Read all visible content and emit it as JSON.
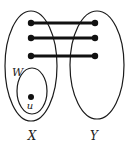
{
  "diagram": {
    "sets": [
      {
        "id": "X",
        "label": "X",
        "cx": 31,
        "cy": 66,
        "rx": 26,
        "ry": 55,
        "label_x": 32,
        "label_y": 140
      },
      {
        "id": "Y",
        "label": "Y",
        "cx": 97,
        "cy": 65,
        "rx": 27,
        "ry": 54,
        "label_x": 94,
        "label_y": 140
      }
    ],
    "subset": {
      "id": "W",
      "label": "W",
      "cx": 32,
      "cy": 91,
      "rx": 15,
      "ry": 23,
      "label_x": 12,
      "label_y": 76
    },
    "special_vertex": {
      "label": "u",
      "x": 31,
      "y": 97,
      "label_x": 30,
      "label_y": 109
    },
    "edges": [
      {
        "x1": 31,
        "y1": 23,
        "x2": 95,
        "y2": 23
      },
      {
        "x1": 31,
        "y1": 38,
        "x2": 95,
        "y2": 38
      },
      {
        "x1": 31,
        "y1": 56,
        "x2": 95,
        "y2": 56
      }
    ],
    "colors": {
      "stroke": "#1a1a1a",
      "vertex": "#111111",
      "background": "#ffffff"
    }
  }
}
